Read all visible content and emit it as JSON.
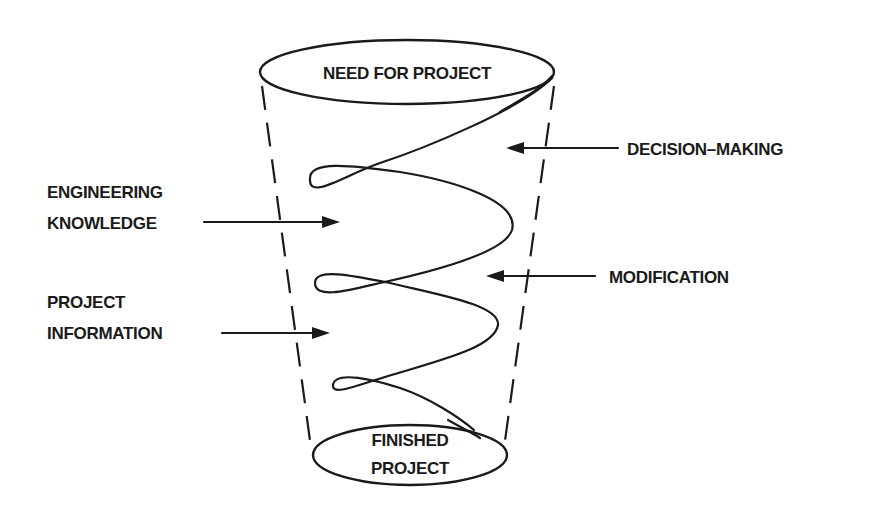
{
  "diagram": {
    "top_ellipse_label": "NEED FOR PROJECT",
    "bottom_ellipse_label": [
      "FINISHED",
      "PROJECT"
    ],
    "left_labels": [
      {
        "lines": [
          "ENGINEERING",
          "KNOWLEDGE"
        ],
        "arrow_direction": "right"
      },
      {
        "lines": [
          "PROJECT",
          "INFORMATION"
        ],
        "arrow_direction": "right"
      }
    ],
    "right_labels": [
      {
        "text": "DECISION–MAKING",
        "arrow_direction": "left"
      },
      {
        "text": "MODIFICATION",
        "arrow_direction": "left"
      }
    ],
    "colors": {
      "ink": "#1a1a1a",
      "background": "#ffffff"
    }
  }
}
